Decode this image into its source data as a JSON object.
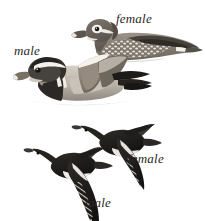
{
  "plate": {
    "subject": "Mandarin Duck",
    "background_color": "#ffffff",
    "width": 205,
    "height": 221
  },
  "labels": {
    "swimming_female": "female",
    "swimming_male": "male",
    "flying_female": "female",
    "flying_male": "male"
  },
  "figures": {
    "swimming_female": {
      "pose": "swimming",
      "sex": "female",
      "plumage_colors": {
        "head": "#6e6862",
        "body": "#8b8379",
        "flank_spots": "#ffffff",
        "eye_ring": "#ffffff",
        "bill": "#5d564f",
        "bill_tip": "#e8e4dd",
        "wing_dark": "#3a3631",
        "water_line": "#cfcac3"
      }
    },
    "swimming_male": {
      "pose": "swimming",
      "sex": "male",
      "plumage_colors": {
        "crest": "#3d3a36",
        "face_stripe": "#f2efe9",
        "cheek_ruff": "#97897a",
        "breast": "#2b2825",
        "flank": "#b8b1a7",
        "sail_feather": "#8e8478",
        "sail_edge": "#ffffff",
        "tail": "#232120",
        "bill": "#7a6f64"
      }
    },
    "flying_female": {
      "pose": "flight",
      "sex": "female",
      "plumage_colors": {
        "body": "#1c1a19",
        "wing": "#262321",
        "belly": "#e9e6e1",
        "wing_bar": "#ffffff"
      }
    },
    "flying_male": {
      "pose": "flight",
      "sex": "male",
      "plumage_colors": {
        "body": "#1c1a19",
        "wing": "#262321",
        "belly": "#efece7",
        "wing_bar": "#ffffff"
      }
    }
  }
}
